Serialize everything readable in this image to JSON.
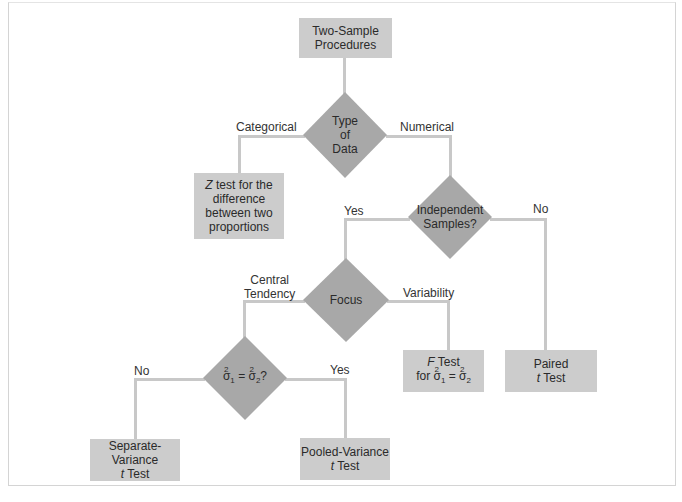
{
  "colors": {
    "box_fill": "#cccccc",
    "diamond_fill": "#a8a8a8",
    "connector": "#c8c8c8",
    "frame_border": "#d4d4d4",
    "text": "#2a2a2a"
  },
  "nodes": {
    "root": {
      "line1": "Two-Sample",
      "line2": "Procedures"
    },
    "type_of_data": {
      "line1": "Type",
      "line2": "of",
      "line3": "Data"
    },
    "z_test": {
      "prefix": "Z",
      "line1": " test for the",
      "line2": "difference",
      "line3": "between two",
      "line4": "proportions"
    },
    "independent": {
      "line1": "Independent",
      "line2": "Samples?"
    },
    "focus": {
      "line1": "Focus"
    },
    "variance_equal": {
      "sigma": "σ",
      "sub1": "1",
      "sub2": "2",
      "sup": "2",
      "eq": " = ",
      "q": "?"
    },
    "f_test": {
      "prefix": "F",
      "line1": " Test",
      "for": "for ",
      "sigma": "σ",
      "sub1": "1",
      "sub2": "2",
      "sup": "2",
      "eq": " = "
    },
    "paired": {
      "line1": "Paired",
      "t": "t",
      "line2": " Test"
    },
    "separate": {
      "line1": "Separate-Variance",
      "t": "t",
      "line2": " Test"
    },
    "pooled": {
      "line1": "Pooled-Variance",
      "t": "t",
      "line2": " Test"
    }
  },
  "edges": {
    "categorical": "Categorical",
    "numerical": "Numerical",
    "indep_yes": "Yes",
    "indep_no": "No",
    "central_1": "Central",
    "central_2": "Tendency",
    "variability": "Variability",
    "var_no": "No",
    "var_yes": "Yes"
  }
}
